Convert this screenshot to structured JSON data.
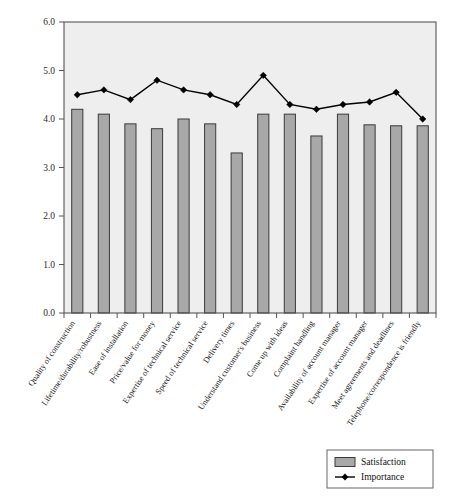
{
  "chart_data": {
    "type": "bar",
    "title": "",
    "subtitle": "",
    "xlabel": "",
    "ylabel": "",
    "ylim": [
      0.0,
      6.0
    ],
    "ytick_labels": [
      "0.0",
      "1.0",
      "2.0",
      "3.0",
      "4.0",
      "5.0",
      "6.0"
    ],
    "ytick_values": [
      0.0,
      1.0,
      2.0,
      3.0,
      4.0,
      5.0,
      6.0
    ],
    "grid": false,
    "legend_position": "bottom-right",
    "categories": [
      "Quality of construction",
      "Lifetime/durability/robustness",
      "Ease of installation",
      "Price/value for money",
      "Expertise of technical service",
      "Speed of technical service",
      "Delivery times",
      "Understand customer's business",
      "Come up with ideas",
      "Complaint handling",
      "Availability of account manager",
      "Expertise of account manager",
      "Meet agreements and deadlines",
      "Telephone/correspondence is friendly"
    ],
    "series": [
      {
        "name": "Satisfaction",
        "type": "bar",
        "color": "#a8a8a8",
        "values": [
          4.2,
          4.1,
          3.9,
          3.8,
          4.0,
          3.9,
          3.3,
          4.1,
          4.1,
          3.65,
          4.1,
          3.88,
          3.86,
          3.86
        ]
      },
      {
        "name": "Importance",
        "type": "line",
        "color": "#000000",
        "marker": "diamond",
        "values": [
          4.5,
          4.6,
          4.4,
          4.8,
          4.6,
          4.5,
          4.3,
          4.9,
          4.3,
          4.2,
          4.3,
          4.35,
          4.55,
          4.0
        ]
      }
    ],
    "legend": [
      {
        "label": "Satisfaction",
        "marker": "bar-swatch",
        "color": "#a8a8a8"
      },
      {
        "label": "Importance",
        "marker": "line-diamond",
        "color": "#000000"
      }
    ]
  },
  "plot": {
    "background_color": "#eeeeee",
    "border_color": "#555555",
    "axis_color": "#555555"
  }
}
